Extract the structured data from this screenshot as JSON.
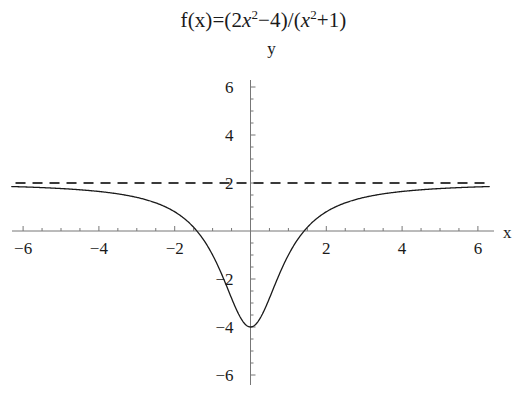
{
  "chart_data": {
    "type": "line",
    "title_parts": {
      "prefix": "f(x)=(2",
      "var1": "x",
      "exp1": "2",
      "mid": "−4)/(",
      "var2": "x",
      "exp2": "2",
      "suffix": "+1)"
    },
    "xlabel": "x",
    "ylabel": "y",
    "xlim": [
      -6.3,
      6.3
    ],
    "ylim": [
      -6.6,
      6.6
    ],
    "xticks": [
      -6,
      -4,
      -2,
      2,
      4,
      6
    ],
    "xtick_labels": [
      "−6",
      "−4",
      "−2",
      "2",
      "4",
      "6"
    ],
    "yticks": [
      6,
      4,
      2,
      -2,
      -4,
      -6
    ],
    "ytick_labels": [
      "6",
      "4",
      "2",
      "−2",
      "−4",
      "−6"
    ],
    "x_minor_step": 0.5,
    "y_minor_step": 0.5,
    "grid": false,
    "legend": null,
    "series": [
      {
        "name": "f(x)=(2x^2-4)/(x^2+1)",
        "style": "solid",
        "color": "#1a1a1a",
        "linewidth": 1.3,
        "formula": "(2*x*x - 4)/(x*x + 1)",
        "x_domain": [
          -6.3,
          6.3
        ],
        "key_points": {
          "minimum": [
            0,
            -4
          ],
          "x_intercepts": [
            -1.414,
            1.414
          ],
          "y_intercept": [
            0,
            -4
          ],
          "value_at_minus6": 1.838,
          "value_at_6": 1.838
        }
      },
      {
        "name": "horizontal asymptote y=2",
        "style": "dashed",
        "color": "#3a3a3a",
        "linewidth": 1.8,
        "constant_y": 2,
        "x_domain": [
          -6.2,
          6.2
        ],
        "dash_pattern": [
          10,
          7
        ]
      }
    ],
    "axis_color": "#777777",
    "background": "#ffffff"
  },
  "geometry": {
    "origin_px": [
      250.5,
      231.0
    ],
    "x_unit_px": 37.9,
    "y_unit_px": 24.0,
    "x_axis_span_px": [
      12,
      494
    ],
    "y_axis_span_px": [
      80,
      385
    ],
    "tick_major_px": 5,
    "tick_minor_px": 3
  }
}
